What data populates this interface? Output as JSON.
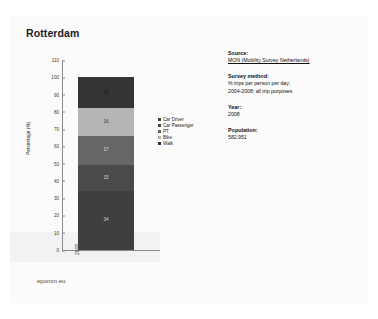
{
  "slide": {
    "title": "Rotterdam",
    "footer": "epomm.eu"
  },
  "chart_data": {
    "type": "bar",
    "title": "Rotterdam",
    "xlabel": "",
    "ylabel": "Percentage (%)",
    "categories": [
      "2008"
    ],
    "ylim": [
      0,
      110
    ],
    "yticks": [
      "0",
      "10",
      "20",
      "30",
      "40",
      "50",
      "60",
      "70",
      "80",
      "90",
      "100",
      "110"
    ],
    "grid": false,
    "legend_position": "right",
    "stacked": true,
    "series": [
      {
        "name": "Car Driver",
        "values": [
          34
        ],
        "label": "34",
        "color": "#3f3f3f",
        "label_color": "#d8d8d8"
      },
      {
        "name": "Car Passenger",
        "values": [
          15
        ],
        "label": "15",
        "color": "#4a4a4a",
        "label_color": "#d8d8d8"
      },
      {
        "name": "PT",
        "values": [
          17
        ],
        "label": "17",
        "color": "#666666",
        "label_color": "#e0e0e0"
      },
      {
        "name": "Bike",
        "values": [
          16
        ],
        "label": "16",
        "color": "#b5b5b5",
        "label_color": "#3a3a3a"
      },
      {
        "name": "Walk",
        "values": [
          18
        ],
        "label": "18",
        "color": "#343434",
        "label_color": "#161616"
      }
    ]
  },
  "info": {
    "source_head": "Source:",
    "source_value": "MON (Mobility Survey Netherlands)",
    "method_head": "Survey method:",
    "method_line1": "% trips per person per day;",
    "method_line2": "2004-2008; all trip purposes",
    "year_head": "Year:",
    "year_value": "2008",
    "population_head": "Population:",
    "population_value": "582.951"
  }
}
